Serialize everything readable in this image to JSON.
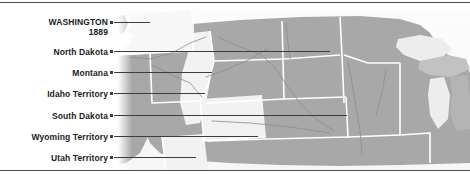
{
  "figure": {
    "kind": "historical-us-map",
    "colors": {
      "state_fill": "#a8a8a8",
      "territory_fill": "#f2f2f2",
      "highlight_fill": "#f7f7f7",
      "border_line": "#ffffff",
      "river_line": "#8d8d8d",
      "leader_line": "#3d3d3d",
      "rule_line": "#4a4a4a",
      "label_text": "#1c1c1c",
      "background": "#fbfbfb",
      "lake_fill": "#ededed"
    }
  },
  "labels": [
    {
      "id": "washington",
      "name": "WASHINGTON",
      "year": "1889",
      "kind": "state",
      "x": 8,
      "y": 14,
      "width": 100,
      "line_y": 19,
      "line_to": 150
    },
    {
      "id": "north-dakota",
      "name": "North Dakota",
      "year": "",
      "kind": "state",
      "x": 8,
      "y": 44,
      "width": 100,
      "line_y": 48,
      "line_to": 330
    },
    {
      "id": "montana",
      "name": "Montana",
      "year": "",
      "kind": "state",
      "x": 8,
      "y": 65,
      "width": 100,
      "line_y": 69,
      "line_to": 212
    },
    {
      "id": "idaho-territory",
      "name": "Idaho Territory",
      "year": "",
      "kind": "territory",
      "x": 8,
      "y": 86,
      "width": 100,
      "line_y": 90,
      "line_to": 205
    },
    {
      "id": "south-dakota",
      "name": "South Dakota",
      "year": "",
      "kind": "state",
      "x": 8,
      "y": 108,
      "width": 100,
      "line_y": 112,
      "line_to": 347
    },
    {
      "id": "wyoming-territory",
      "name": "Wyoming Territory",
      "year": "",
      "kind": "territory",
      "x": 8,
      "y": 129,
      "width": 100,
      "line_y": 133,
      "line_to": 258
    },
    {
      "id": "utah-territory",
      "name": "Utah Territory",
      "year": "",
      "kind": "territory",
      "x": 8,
      "y": 150,
      "width": 100,
      "line_y": 154,
      "line_to": 196
    }
  ],
  "map_data": {
    "type": "choropleth-outline",
    "highlighted_region": "WASHINGTON",
    "highlight_year": "1889",
    "states_shown": [
      "Washington",
      "North Dakota",
      "Montana",
      "South Dakota",
      "Oregon",
      "Minnesota",
      "Wisconsin",
      "Michigan",
      "Nebraska",
      "Iowa"
    ],
    "territories_shown": [
      "Idaho Territory",
      "Wyoming Territory",
      "Utah Territory"
    ],
    "water_features": [
      "Puget Sound",
      "Lake Superior",
      "Lake Michigan"
    ]
  }
}
